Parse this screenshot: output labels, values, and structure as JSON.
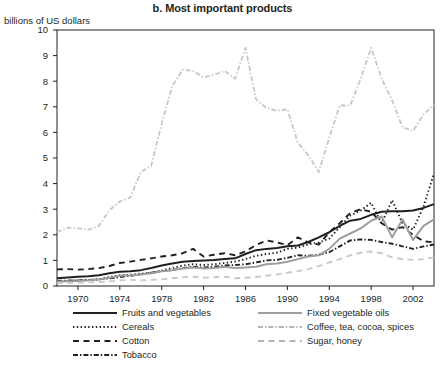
{
  "chart_data": {
    "type": "line",
    "title": "b. Most important products",
    "ylabel": "billions of US dollars",
    "xlabel": "",
    "ylim": [
      0,
      10
    ],
    "xlim": [
      1968,
      2004
    ],
    "ytick_labels": [
      "0",
      "1",
      "2",
      "3",
      "4",
      "5",
      "6",
      "7",
      "8",
      "9",
      "10"
    ],
    "yticks": [
      0,
      1,
      2,
      3,
      4,
      5,
      6,
      7,
      8,
      9,
      10
    ],
    "xtick_labels": [
      "1970",
      "1974",
      "1978",
      "1982",
      "1986",
      "1990",
      "1994",
      "1998",
      "2002"
    ],
    "xticks": [
      1970,
      1974,
      1978,
      1982,
      1986,
      1990,
      1994,
      1998,
      2002
    ],
    "grid": false,
    "legend_position": "below",
    "x": [
      1968,
      1969,
      1970,
      1971,
      1972,
      1973,
      1974,
      1975,
      1976,
      1977,
      1978,
      1979,
      1980,
      1981,
      1982,
      1983,
      1984,
      1985,
      1986,
      1987,
      1988,
      1989,
      1990,
      1991,
      1992,
      1993,
      1994,
      1995,
      1996,
      1997,
      1998,
      1999,
      2000,
      2001,
      2002,
      2003,
      2004
    ],
    "series": [
      {
        "name": "Fruits and vegetables",
        "style": "solid",
        "color": "#231f20",
        "width": 2.0,
        "values": [
          0.3,
          0.33,
          0.36,
          0.38,
          0.42,
          0.5,
          0.56,
          0.58,
          0.62,
          0.7,
          0.8,
          0.88,
          0.95,
          0.98,
          1.0,
          1.02,
          1.05,
          1.08,
          1.25,
          1.4,
          1.45,
          1.48,
          1.55,
          1.58,
          1.72,
          1.9,
          2.1,
          2.35,
          2.55,
          2.62,
          2.78,
          2.9,
          2.92,
          2.92,
          2.95,
          3.05,
          3.2
        ]
      },
      {
        "name": "Cereals",
        "style": "dotted",
        "color": "#231f20",
        "width": 1.9,
        "values": [
          0.18,
          0.2,
          0.22,
          0.23,
          0.26,
          0.35,
          0.42,
          0.44,
          0.48,
          0.52,
          0.6,
          0.7,
          0.8,
          0.85,
          0.82,
          0.85,
          0.9,
          0.95,
          1.05,
          1.18,
          1.25,
          1.3,
          1.45,
          1.5,
          1.62,
          1.7,
          1.85,
          2.3,
          2.75,
          2.95,
          3.25,
          2.45,
          3.35,
          2.45,
          2.2,
          3.1,
          4.4
        ]
      },
      {
        "name": "Cotton",
        "style": "dashed",
        "color": "#231f20",
        "width": 1.9,
        "values": [
          0.65,
          0.66,
          0.64,
          0.66,
          0.7,
          0.78,
          0.9,
          0.95,
          1.02,
          1.08,
          1.15,
          1.2,
          1.28,
          1.45,
          1.15,
          1.22,
          1.28,
          1.2,
          1.35,
          1.6,
          1.78,
          1.7,
          1.6,
          1.9,
          1.7,
          1.62,
          2.1,
          2.45,
          2.85,
          3.0,
          2.9,
          2.45,
          2.2,
          2.3,
          2.0,
          1.75,
          1.7
        ]
      },
      {
        "name": "Tobacco",
        "style": "dashdot",
        "color": "#231f20",
        "width": 1.9,
        "values": [
          0.2,
          0.21,
          0.22,
          0.24,
          0.26,
          0.3,
          0.35,
          0.4,
          0.45,
          0.52,
          0.58,
          0.62,
          0.7,
          0.75,
          0.72,
          0.75,
          0.8,
          0.82,
          0.85,
          0.92,
          1.0,
          1.02,
          1.1,
          1.2,
          1.18,
          1.22,
          1.32,
          1.55,
          1.78,
          1.82,
          1.8,
          1.72,
          1.65,
          1.55,
          1.45,
          1.55,
          1.62
        ]
      },
      {
        "name": "Fixed vegetable oils",
        "style": "solid",
        "color": "#9e9e9e",
        "width": 2.0,
        "values": [
          0.18,
          0.19,
          0.2,
          0.22,
          0.25,
          0.32,
          0.4,
          0.42,
          0.45,
          0.5,
          0.58,
          0.62,
          0.68,
          0.72,
          0.68,
          0.7,
          0.75,
          0.7,
          0.72,
          0.75,
          0.85,
          0.88,
          0.95,
          1.05,
          1.15,
          1.2,
          1.45,
          1.85,
          2.05,
          2.25,
          2.55,
          2.72,
          1.9,
          2.6,
          1.8,
          2.35,
          2.6
        ]
      },
      {
        "name": "Coffee, tea, cocoa, spices",
        "style": "dashdot",
        "color": "#c9c9c9",
        "width": 1.9,
        "values": [
          2.1,
          2.28,
          2.25,
          2.2,
          2.35,
          2.95,
          3.3,
          3.45,
          4.45,
          4.7,
          6.35,
          7.8,
          8.45,
          8.4,
          8.15,
          8.25,
          8.4,
          8.1,
          9.3,
          7.3,
          6.95,
          6.85,
          6.9,
          5.6,
          5.1,
          4.45,
          5.8,
          7.05,
          7.05,
          8.1,
          9.3,
          8.1,
          7.25,
          6.2,
          6.05,
          6.7,
          7.1
        ]
      },
      {
        "name": "Sugar, honey",
        "style": "dashed",
        "color": "#c9c9c9",
        "width": 1.9,
        "values": [
          0.12,
          0.12,
          0.13,
          0.14,
          0.15,
          0.18,
          0.22,
          0.24,
          0.22,
          0.24,
          0.26,
          0.3,
          0.34,
          0.36,
          0.32,
          0.34,
          0.36,
          0.3,
          0.32,
          0.35,
          0.4,
          0.45,
          0.52,
          0.58,
          0.66,
          0.78,
          0.92,
          1.05,
          1.2,
          1.3,
          1.35,
          1.28,
          1.12,
          1.05,
          1.02,
          1.05,
          1.12
        ]
      }
    ]
  },
  "legend": {
    "columns": [
      {
        "items": [
          {
            "label": "Fruits and vegetables",
            "series": 0
          },
          {
            "label": "Cereals",
            "series": 1
          },
          {
            "label": "Cotton",
            "series": 2
          },
          {
            "label": "Tobacco",
            "series": 3
          }
        ]
      },
      {
        "items": [
          {
            "label": "Fixed vegetable oils",
            "series": 4
          },
          {
            "label": "Coffee, tea, cocoa, spices",
            "series": 5
          },
          {
            "label": "Sugar, honey",
            "series": 6
          }
        ]
      }
    ]
  },
  "colors": {
    "text": "#231f20",
    "axis": "#231f20",
    "dark_series": "#231f20",
    "mid_gray_series": "#9e9e9e",
    "light_gray_series": "#c9c9c9",
    "background": "#ffffff"
  }
}
